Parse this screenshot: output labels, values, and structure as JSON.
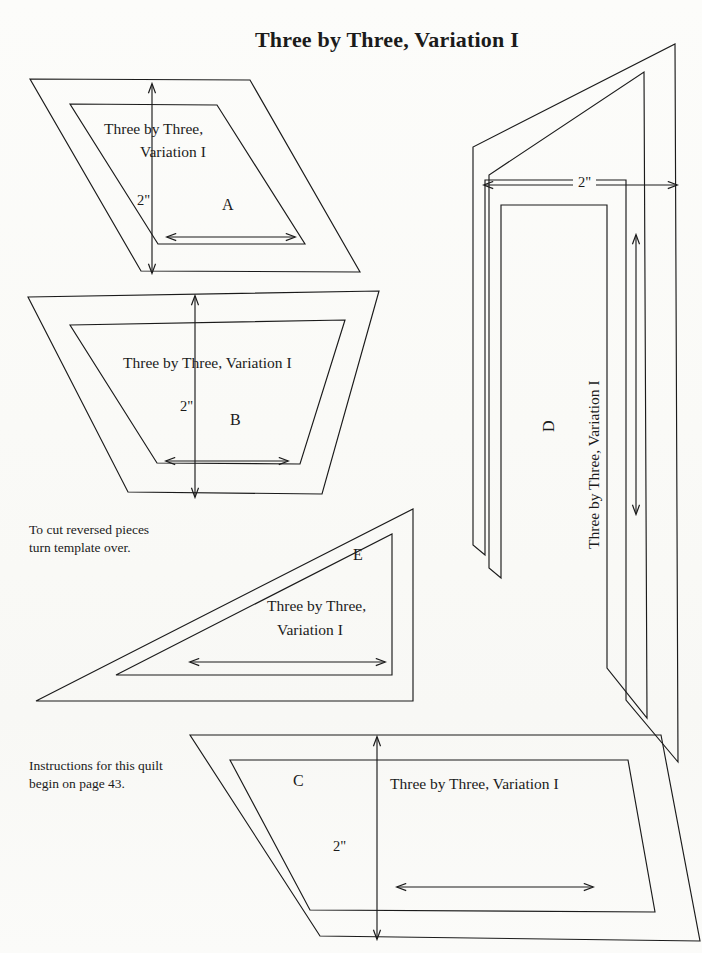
{
  "page": {
    "title": "Three by Three, Variation I",
    "width": 702,
    "height": 953,
    "background_color": "#fbfbf9",
    "ink_color": "#1b1b1b"
  },
  "notes": [
    {
      "id": "reversed-pieces",
      "line1": "To cut reversed pieces",
      "line2": "turn template over."
    },
    {
      "id": "instructions",
      "line1": "Instructions for this quilt",
      "line2": "begin on page 43."
    }
  ],
  "templates": [
    {
      "id": "A",
      "letter": "A",
      "shape": "parallelogram",
      "caption_line1": "Three  by Three,",
      "caption_line2": "Variation I",
      "dimension_label": "2\"",
      "dimension_axis": "vertical",
      "grain_arrow": "horizontal-double"
    },
    {
      "id": "B",
      "letter": "B",
      "shape": "trapezoid",
      "caption_line1": "Three by  Three, Variation I",
      "caption_line2": "",
      "dimension_label": "2\"",
      "dimension_axis": "vertical",
      "grain_arrow": "horizontal-double"
    },
    {
      "id": "C",
      "letter": "C",
      "shape": "parallelogram-wide",
      "caption_line1": "Three by Three, Variation I",
      "caption_line2": "",
      "dimension_label": "2\"",
      "dimension_axis": "vertical",
      "grain_arrow": "horizontal-double"
    },
    {
      "id": "D",
      "letter": "D",
      "shape": "tall-angled-strip",
      "caption_line1": "Three by Three, Variation I",
      "caption_line2": "",
      "dimension_label": "2\"",
      "dimension_axis": "horizontal",
      "grain_arrow": "vertical-double"
    },
    {
      "id": "E",
      "letter": "E",
      "shape": "right-triangle",
      "caption_line1": "Three by Three,",
      "caption_line2": "Variation I",
      "dimension_label": "",
      "dimension_axis": "none",
      "grain_arrow": "horizontal-double"
    }
  ]
}
